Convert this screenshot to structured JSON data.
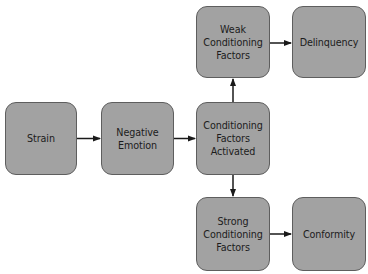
{
  "diagram": {
    "type": "flowchart",
    "colors": {
      "node_fill": "#a2a2a2",
      "node_border": "#5e5e5e",
      "text": "#1c1c1c",
      "arrow": "#1a1a1a",
      "background": "#ffffff"
    },
    "nodes": [
      {
        "id": "strain",
        "label": "Strain"
      },
      {
        "id": "negative_emotion",
        "label": "Negative\nEmotion"
      },
      {
        "id": "conditioning_activated",
        "label": "Conditioning\nFactors\nActivated"
      },
      {
        "id": "weak_conditioning",
        "label": "Weak\nConditioning\nFactors"
      },
      {
        "id": "delinquency",
        "label": "Delinquency"
      },
      {
        "id": "strong_conditioning",
        "label": "Strong\nConditioning\nFactors"
      },
      {
        "id": "conformity",
        "label": "Conformity"
      }
    ],
    "edges": [
      {
        "from": "strain",
        "to": "negative_emotion"
      },
      {
        "from": "negative_emotion",
        "to": "conditioning_activated"
      },
      {
        "from": "conditioning_activated",
        "to": "weak_conditioning"
      },
      {
        "from": "conditioning_activated",
        "to": "strong_conditioning"
      },
      {
        "from": "weak_conditioning",
        "to": "delinquency"
      },
      {
        "from": "strong_conditioning",
        "to": "conformity"
      }
    ]
  }
}
